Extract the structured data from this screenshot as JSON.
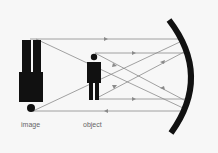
{
  "diagram": {
    "type": "concave-mirror-ray-diagram",
    "labels": {
      "image": "image",
      "object": "object"
    },
    "colors": {
      "background": "#f7f7f7",
      "figure": "#111111",
      "mirror": "#111111",
      "ray": "#8a8a8a",
      "label": "#666666"
    },
    "elements": [
      {
        "name": "image-figure",
        "description": "inverted, magnified figure"
      },
      {
        "name": "object-figure",
        "description": "upright figure"
      },
      {
        "name": "concave-mirror",
        "description": "curved mirror on right"
      }
    ]
  }
}
